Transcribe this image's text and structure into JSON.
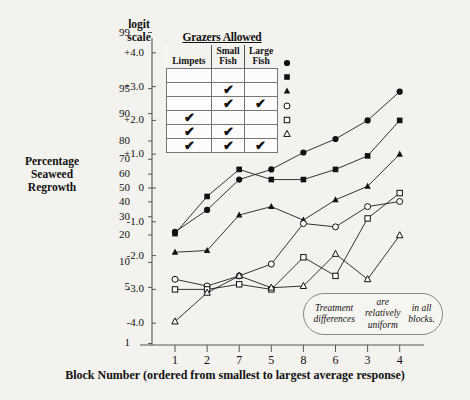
{
  "axes": {
    "y_title": "Percentage\nSeaweed\nRegrowth",
    "y_title_lines": [
      "Percentage",
      "Seaweed",
      "Regrowth"
    ],
    "scale_title_lines": [
      "logit",
      "scale"
    ],
    "x_title": "Block Number (ordered from smallest to largest average response)",
    "percent_ticks": [
      "99",
      "95",
      "90",
      "80",
      "70",
      "60",
      "50",
      "40",
      "30",
      "20",
      "10",
      "5",
      "1"
    ],
    "logit_ticks": [
      "+4.0",
      "+3.0",
      "+2.0",
      "+1.0",
      "0",
      "-1.0",
      "-2.0",
      "-3.0",
      "-4.0"
    ],
    "x_ticks": [
      "1",
      "2",
      "7",
      "5",
      "8",
      "6",
      "3",
      "4"
    ]
  },
  "legend": {
    "title": "Grazers Allowed",
    "columns": [
      "Limpets",
      "Small Fish",
      "Large Fish"
    ],
    "column_lines": [
      [
        "Limpets"
      ],
      [
        "Small",
        "Fish"
      ],
      [
        "Large",
        "Fish"
      ]
    ],
    "check_glyph": "✔",
    "rows": [
      {
        "marker": "filled-circle",
        "limpets": false,
        "small_fish": false,
        "large_fish": false
      },
      {
        "marker": "filled-square",
        "limpets": false,
        "small_fish": true,
        "large_fish": false
      },
      {
        "marker": "filled-triangle",
        "limpets": false,
        "small_fish": true,
        "large_fish": true
      },
      {
        "marker": "open-circle",
        "limpets": true,
        "small_fish": false,
        "large_fish": false
      },
      {
        "marker": "open-square",
        "limpets": true,
        "small_fish": true,
        "large_fish": false
      },
      {
        "marker": "open-triangle",
        "limpets": true,
        "small_fish": true,
        "large_fish": true
      }
    ]
  },
  "annotation": {
    "lines": [
      "Treatment differences",
      "are relatively uniform",
      "in all blocks."
    ],
    "text": "Treatment differences are relatively uniform in all blocks."
  },
  "colors": {
    "background": "#f4f2ee",
    "ink": "#111111",
    "axis": "#555555",
    "callout_border": "#888888"
  },
  "chart_data": {
    "type": "line",
    "title": "",
    "xlabel": "Block Number (ordered from smallest to largest average response)",
    "ylabel": "Percentage Seaweed Regrowth",
    "secondary_ylabel": "logit scale",
    "categories": [
      "1",
      "2",
      "7",
      "5",
      "8",
      "6",
      "3",
      "4"
    ],
    "ylim_logit": [
      -4.6,
      4.6
    ],
    "ylim_percent": [
      1,
      99
    ],
    "grid": false,
    "legend_position": "inside-top-center",
    "y_axis_note": "Left axis is percentage; right-of-axis labels are the matching logit values.",
    "percent_tick_logits": {
      "99": 4.6,
      "95": 2.94,
      "90": 2.2,
      "80": 1.39,
      "70": 0.85,
      "60": 0.41,
      "50": 0.0,
      "40": -0.41,
      "30": -0.85,
      "20": -1.39,
      "10": -2.2,
      "5": -2.94,
      "1": -4.6
    },
    "series": [
      {
        "name": "None",
        "marker": "filled-circle",
        "fill": true,
        "shape": "circle",
        "values": [
          -1.3,
          -0.65,
          0.25,
          0.55,
          1.05,
          1.45,
          2.0,
          2.85
        ]
      },
      {
        "name": "Small Fish",
        "marker": "filled-square",
        "fill": true,
        "shape": "square",
        "values": [
          -1.35,
          -0.25,
          0.55,
          0.25,
          0.25,
          0.55,
          0.95,
          2.0
        ]
      },
      {
        "name": "Small Fish + Large Fish",
        "marker": "filled-triangle",
        "fill": true,
        "shape": "triangle",
        "values": [
          -1.9,
          -1.85,
          -0.8,
          -0.55,
          -0.95,
          -0.35,
          0.05,
          1.0
        ]
      },
      {
        "name": "Limpets",
        "marker": "open-circle",
        "fill": false,
        "shape": "circle",
        "values": [
          -2.7,
          -2.9,
          -2.6,
          -2.25,
          -1.05,
          -1.15,
          -0.55,
          -0.4
        ]
      },
      {
        "name": "Limpets + Small Fish",
        "marker": "open-square",
        "fill": false,
        "shape": "square",
        "values": [
          -3.0,
          -3.0,
          -2.85,
          -3.0,
          -2.05,
          -2.6,
          -0.9,
          -0.15
        ]
      },
      {
        "name": "Limpets + Small Fish + Large Fish",
        "marker": "open-triangle",
        "fill": false,
        "shape": "triangle",
        "values": [
          -3.95,
          -3.1,
          -2.6,
          -2.95,
          -2.9,
          -1.95,
          -2.7,
          -1.4
        ]
      }
    ]
  }
}
